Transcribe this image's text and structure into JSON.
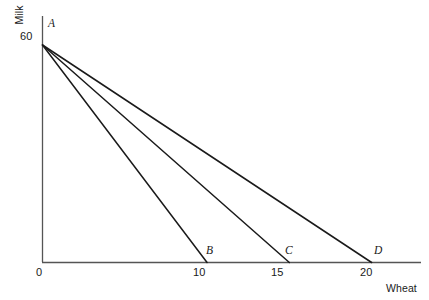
{
  "chart_data": {
    "type": "line",
    "title": "",
    "xlabel": "Wheat",
    "ylabel": "Milk",
    "xlim": [
      0,
      23
    ],
    "ylim": [
      0,
      68
    ],
    "grid": false,
    "legend": "none",
    "x_ticks": [
      "0",
      "10",
      "15",
      "20"
    ],
    "x_tick_values": [
      0,
      10,
      15,
      20
    ],
    "y_ticks": [
      "60"
    ],
    "y_tick_values": [
      60
    ],
    "annotations": [
      "A",
      "B",
      "C",
      "D"
    ],
    "origin_point": {
      "label": "A",
      "wheat": 0,
      "milk": 60
    },
    "series": [
      {
        "name": "A-B",
        "endpoint_label": "B",
        "x": [
          0,
          10
        ],
        "y": [
          60,
          0
        ]
      },
      {
        "name": "A-C",
        "endpoint_label": "C",
        "x": [
          0,
          15
        ],
        "y": [
          60,
          0
        ]
      },
      {
        "name": "A-D",
        "endpoint_label": "D",
        "x": [
          0,
          20
        ],
        "y": [
          60,
          0
        ]
      }
    ]
  },
  "axes": {
    "y_title": "Milk",
    "x_title": "Wheat",
    "y_tick_60": "60",
    "x_tick_0": "0",
    "x_tick_10": "10",
    "x_tick_15": "15",
    "x_tick_20": "20"
  },
  "points": {
    "a": "A",
    "b": "B",
    "c": "C",
    "d": "D"
  },
  "header": {
    "cropped_text": ""
  },
  "colors": {
    "line": "#1a1a1a",
    "axis": "#555555",
    "text": "#1a1a1a",
    "background": "#ffffff"
  }
}
